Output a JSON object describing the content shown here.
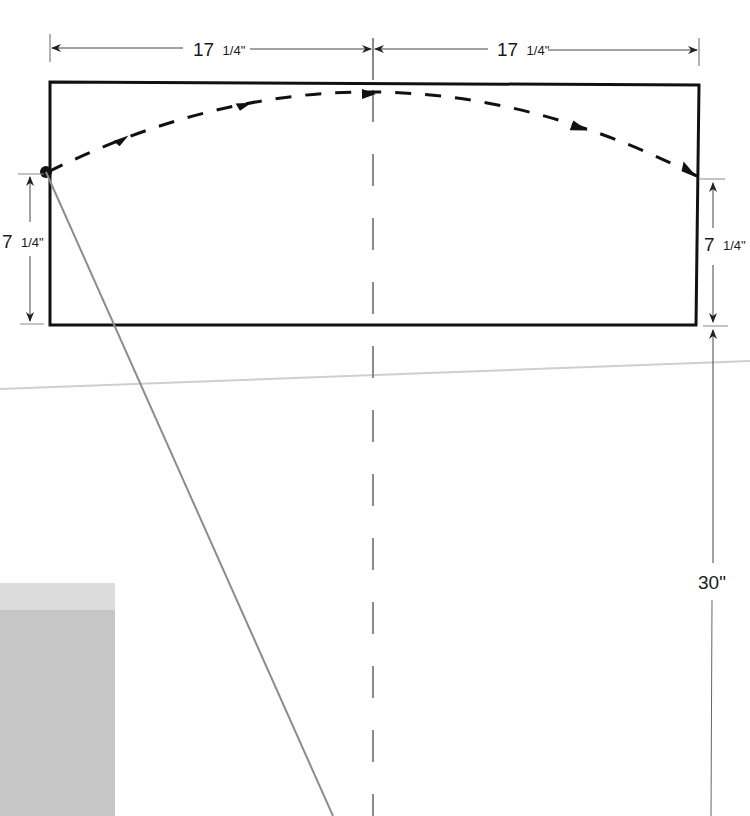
{
  "diagram": {
    "type": "dimensioned-layout-drawing",
    "colors": {
      "outline": "#111111",
      "dimension_line": "#555555",
      "centerline": "#8a8a8a",
      "diagonal": "#8c8c8c",
      "gray_block": "#c4c4c4",
      "gray_block_top": "#dcdcdc",
      "horizon": "#cfcfcf"
    },
    "dimensions": {
      "top_left": {
        "whole": "17",
        "fraction": "1/4\"",
        "label": "17 1/4\""
      },
      "top_right": {
        "whole": "17",
        "fraction": "1/4\"",
        "label": "17 1/4\""
      },
      "left_height": {
        "whole": "7",
        "fraction": "1/4\"",
        "label": "7 1/4\""
      },
      "right_height": {
        "whole": "7",
        "fraction": "1/4\"",
        "label": "7 1/4\""
      },
      "bottom_drop": {
        "label": "30\""
      }
    },
    "elements": {
      "rectangle": "panel outline",
      "centerline": "vertical dashed center line",
      "arc": "dashed arc with direction arrows from left point to right edge",
      "pivot_point": "black dot on left edge",
      "diagonal": "gray line from pivot point downward",
      "gray_block": "gray rectangle at lower left"
    }
  }
}
